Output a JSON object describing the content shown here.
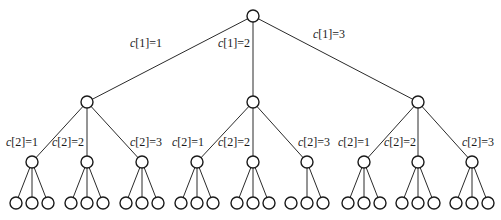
{
  "diagram": {
    "type": "tree",
    "node_radius": 6,
    "root": {
      "x": 253,
      "y": 16
    },
    "level1": [
      {
        "x": 87,
        "y": 102,
        "label": "c[1]=1",
        "label_x": 130,
        "label_y": 47
      },
      {
        "x": 253,
        "y": 102,
        "label": "c[1]=2",
        "label_x": 218,
        "label_y": 47
      },
      {
        "x": 418,
        "y": 102,
        "label": "c[1]=3",
        "label_x": 313,
        "label_y": 38
      }
    ],
    "level2": [
      {
        "parent": 0,
        "x": 32,
        "y": 162,
        "label": "c[2]=1",
        "label_x": 6,
        "label_y": 146
      },
      {
        "parent": 0,
        "x": 87,
        "y": 162,
        "label": "c[2]=2",
        "label_x": 52,
        "label_y": 146
      },
      {
        "parent": 0,
        "x": 142,
        "y": 162,
        "label": "c[2]=3",
        "label_x": 130,
        "label_y": 146
      },
      {
        "parent": 1,
        "x": 197,
        "y": 162,
        "label": "c[2]=1",
        "label_x": 172,
        "label_y": 146
      },
      {
        "parent": 1,
        "x": 253,
        "y": 162,
        "label": "c[2]=2",
        "label_x": 218,
        "label_y": 146
      },
      {
        "parent": 1,
        "x": 307,
        "y": 162,
        "label": "c[2]=3",
        "label_x": 298,
        "label_y": 146
      },
      {
        "parent": 2,
        "x": 364,
        "y": 162,
        "label": "c[2]=1",
        "label_x": 338,
        "label_y": 146
      },
      {
        "parent": 2,
        "x": 418,
        "y": 162,
        "label": "c[2]=2",
        "label_x": 384,
        "label_y": 146
      },
      {
        "parent": 2,
        "x": 472,
        "y": 162,
        "label": "c[2]=3",
        "label_x": 462,
        "label_y": 146
      }
    ],
    "leaf_y": 203,
    "leaf_spacing": 16,
    "missing_leaf_edges": [
      {
        "level2_index": 5,
        "leaf_index": 0
      }
    ]
  }
}
